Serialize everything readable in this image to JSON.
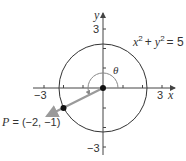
{
  "figure": {
    "axes": {
      "x_label": "x",
      "y_label": "y",
      "x_tick_neg": "−3",
      "x_tick_pos": "3",
      "y_tick_pos": "3",
      "y_tick_neg": "−3"
    },
    "circle": {
      "equation_x": "x",
      "equation_plus": "+",
      "equation_y": "y",
      "equation_exp": "2",
      "equation_rhs": "= 5",
      "radius_squared": 5
    },
    "point": {
      "label": "P = (−2, −1)",
      "x": -2,
      "y": -1
    },
    "angle": {
      "label": "θ"
    },
    "colors": {
      "axis": "#444444",
      "circle": "#333333",
      "ray": "#9a9a9a",
      "arc": "#888888",
      "point": "#111111"
    }
  }
}
